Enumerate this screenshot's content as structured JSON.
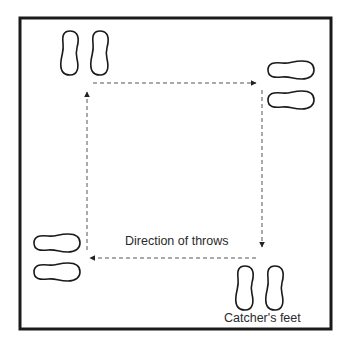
{
  "diagram": {
    "labels": {
      "direction": "Direction of throws",
      "catcher": "Catcher's feet"
    },
    "colors": {
      "stroke": "#1a1a1a",
      "dash": "#555555",
      "background": "#ffffff"
    },
    "feet_positions": [
      "top-left",
      "top-right",
      "bottom-left",
      "bottom-right"
    ],
    "arrows": [
      {
        "from": "top-left",
        "to": "top-right",
        "direction": "right"
      },
      {
        "from": "top-right",
        "to": "bottom-right",
        "direction": "down"
      },
      {
        "from": "bottom-right",
        "to": "bottom-left",
        "direction": "left"
      },
      {
        "from": "bottom-left",
        "to": "top-left",
        "direction": "up"
      }
    ]
  }
}
